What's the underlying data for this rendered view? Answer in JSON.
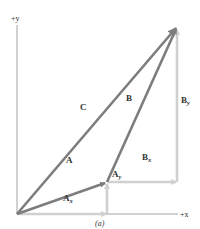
{
  "figure": {
    "caption": "(a)",
    "axes": {
      "x_label": "+x",
      "y_label": "+y",
      "color": "#9a9a9a"
    },
    "colors": {
      "resultant_vectors": "#7d7d7d",
      "component_vectors": "#d0d0d0",
      "text": "#333333"
    },
    "vectors": [
      {
        "id": "A",
        "label": "A",
        "from": [
          17,
          214
        ],
        "to": [
          107,
          182
        ],
        "kind": "vector"
      },
      {
        "id": "B",
        "label": "B",
        "from": [
          107,
          182
        ],
        "to": [
          177,
          27
        ],
        "kind": "vector"
      },
      {
        "id": "C",
        "label": "C",
        "from": [
          17,
          214
        ],
        "to": [
          177,
          27
        ],
        "kind": "vector"
      }
    ],
    "components": [
      {
        "id": "Ax",
        "label": "A",
        "sub": "x",
        "from": [
          17,
          214
        ],
        "to": [
          107,
          214
        ]
      },
      {
        "id": "Ay",
        "label": "A",
        "sub": "y",
        "from": [
          107,
          214
        ],
        "to": [
          107,
          182
        ]
      },
      {
        "id": "Bx",
        "label": "B",
        "sub": "x",
        "from": [
          107,
          182
        ],
        "to": [
          177,
          182
        ]
      },
      {
        "id": "By",
        "label": "B",
        "sub": "y",
        "from": [
          177,
          182
        ],
        "to": [
          177,
          27
        ]
      }
    ],
    "labels": {
      "A": "A",
      "B": "B",
      "C": "C",
      "Ax_main": "A",
      "Ax_sub": "x",
      "Ay_main": "A",
      "Ay_sub": "y",
      "Bx_main": "B",
      "Bx_sub": "x",
      "By_main": "B",
      "By_sub": "y"
    }
  }
}
